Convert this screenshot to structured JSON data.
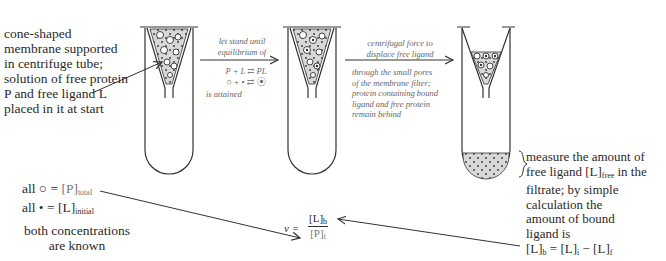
{
  "labels": {
    "start_note": [
      "cone-shaped",
      "membrane supported",
      "in centrifuge tube;",
      "solution of free protein",
      "P and free ligand L",
      "placed in it at start"
    ],
    "step1": {
      "above": [
        "let stand until",
        "equilibrium of"
      ],
      "eq1": "P + L ⇄ PL",
      "eq2": "○ + • ⇄ ⦿",
      "below": "is attained"
    },
    "step2": {
      "above": [
        "centrifugal force to",
        "displace free ligand"
      ],
      "below": [
        "through the small pores",
        "of the membrane filter;",
        "protein containing bound",
        "ligand and free protein",
        "remain behind"
      ]
    },
    "measure": [
      "measure the amount of",
      "free ligand [L]",
      "free",
      " in the",
      "filtrate; by simple",
      "calculation the",
      "amount of bound",
      "ligand is"
    ],
    "bound_eq": {
      "lhs": "[L]",
      "lhs_sub": "b",
      "mid": " = [L]",
      "mid_sub": "i",
      "rhs": " − [L]",
      "rhs_sub": "f"
    },
    "legend": {
      "row1": {
        "prefix": "all ○ = ",
        "value": "[P]",
        "sub": "total"
      },
      "row2": {
        "prefix": "all • = ",
        "value": "[L]",
        "sub": "initial"
      },
      "note": [
        "both concentrations",
        "are known"
      ]
    },
    "nu": {
      "symbol": "ν =",
      "num": "[L]",
      "num_sub": "b",
      "den": "[P]",
      "den_sub": "t"
    }
  }
}
